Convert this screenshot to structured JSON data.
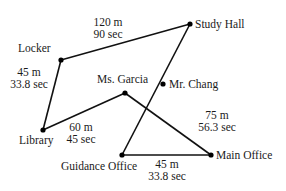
{
  "diagram": {
    "type": "network map",
    "nodes": [
      {
        "id": "locker",
        "label": "Locker",
        "x": 61,
        "y": 60,
        "lx": 18,
        "ly": 52,
        "anchor": "start"
      },
      {
        "id": "study_hall",
        "label": "Study Hall",
        "x": 190,
        "y": 24,
        "lx": 195,
        "ly": 28,
        "anchor": "start"
      },
      {
        "id": "mr_chang",
        "label": "Mr. Chang",
        "x": 163,
        "y": 84,
        "lx": 169,
        "ly": 88,
        "anchor": "start"
      },
      {
        "id": "ms_garcia",
        "label": "Ms. Garcia",
        "x": 125,
        "y": 93,
        "lx": 97,
        "ly": 83,
        "anchor": "start"
      },
      {
        "id": "library",
        "label": "Library",
        "x": 43,
        "y": 130,
        "lx": 19,
        "ly": 144,
        "anchor": "start"
      },
      {
        "id": "guidance_office",
        "label": "Guidance Office",
        "x": 122,
        "y": 155,
        "lx": 61,
        "ly": 170,
        "anchor": "start"
      },
      {
        "id": "main_office",
        "label": "Main Office",
        "x": 211,
        "y": 155,
        "lx": 216,
        "ly": 159,
        "anchor": "start"
      }
    ],
    "edges": [
      {
        "from": "locker",
        "to": "study_hall",
        "distance": "120 m",
        "time": "90 sec",
        "lx": 108,
        "ly": 26
      },
      {
        "from": "locker",
        "to": "library",
        "distance": "45 m",
        "time": "33.8 sec",
        "lx": 29,
        "ly": 76
      },
      {
        "from": "library",
        "to": "ms_garcia",
        "distance": "60 m",
        "time": "45 sec",
        "lx": 81,
        "ly": 131
      },
      {
        "from": "ms_garcia",
        "to": "main_office",
        "distance": "75 m",
        "time": "56.3 sec",
        "lx": 217,
        "ly": 119
      },
      {
        "from": "study_hall",
        "to": "guidance_office",
        "distance": "",
        "time": "",
        "lx": 0,
        "ly": 0
      },
      {
        "from": "guidance_office",
        "to": "main_office",
        "distance": "45 m",
        "time": "33.8 sec",
        "lx": 167,
        "ly": 168
      }
    ]
  }
}
